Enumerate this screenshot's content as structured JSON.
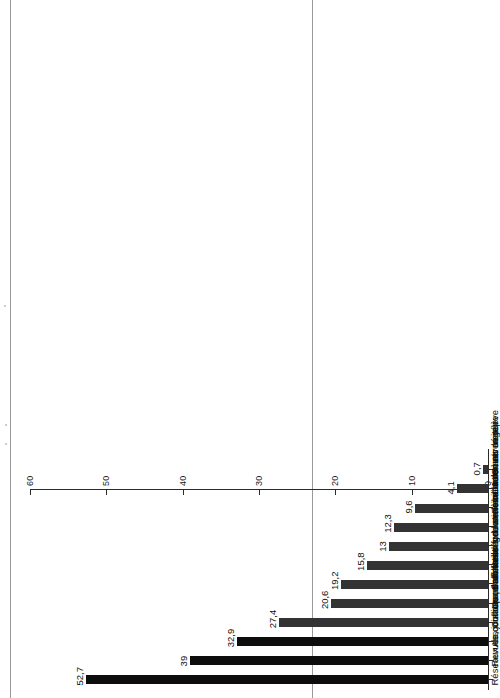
{
  "chart_data": {
    "type": "bar",
    "orientation": "vertical-printed-sideways",
    "title": "",
    "subtitle": "",
    "xlabel": "",
    "ylabel": "",
    "ylim": [
      0,
      60
    ],
    "grid": false,
    "legend": "none",
    "tick_labels": [
      "0",
      "10",
      "20",
      "30",
      "40",
      "50",
      "60"
    ],
    "ticks": [
      0,
      10,
      20,
      30,
      40,
      50,
      60
    ],
    "categories": [
      "Réseaux de contacts personnels",
      "Revues, journaux d'affaires",
      "Associations d'affaires",
      "Colloques sur la relève",
      "Documentation gouvernementale",
      "Brochures sur la relève",
      "Ateliers de sensibilisation sur la relève",
      "Information sur Internet",
      "Livres sur la relève",
      "Formations sur mesure",
      "Cours université",
      "Cours cégep"
    ],
    "values": [
      52.7,
      39,
      32.9,
      27.4,
      20.6,
      19.2,
      15.8,
      13,
      12.3,
      9.6,
      4.1,
      0.7
    ],
    "value_labels": [
      "52,7",
      "39",
      "32,9",
      "27,4",
      "20,6",
      "19,2",
      "15,8",
      "13",
      "12,3",
      "9,6",
      "4,1",
      "0,7"
    ],
    "bar_colors": [
      "#0d0d0d",
      "#0d0d0d",
      "#0d0d0d",
      "#333333",
      "#333333",
      "#333333",
      "#333333",
      "#333333",
      "#333333",
      "#333333",
      "#333333",
      "#333333"
    ]
  },
  "colors": {
    "bar_dark": "#0d0d0d",
    "bar_gray": "#333333",
    "axis": "#2b2b2b",
    "text": "#111111",
    "page_edge": "#9a9a9a",
    "background": "#ffffff"
  }
}
